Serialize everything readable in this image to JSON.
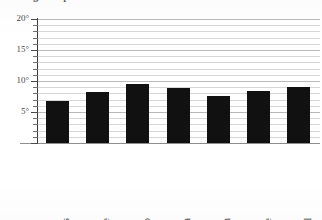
{
  "chart_data": {
    "type": "bar",
    "title": "Average temperature in Celsius",
    "xlabel": "",
    "ylabel": "",
    "categories": [
      "St Andrews",
      "Larne",
      "Sligo",
      "Swansea",
      "Harwich",
      "Eastbourne",
      "St Austell"
    ],
    "values": [
      6.8,
      8.2,
      9.5,
      8.8,
      7.6,
      8.4,
      9.0
    ],
    "ylim": [
      0,
      20
    ],
    "y_major_ticks": [
      "5",
      "10",
      "15",
      "20"
    ],
    "y_tick_labels": [
      "20°",
      "15°",
      "10°",
      "5°"
    ],
    "y_major_step": 5,
    "y_minor_step": 1,
    "grid": true,
    "legend": "none",
    "bar_color": "#111111",
    "gridline_color": "#d7d7d7",
    "axis_color": "#3a3a3a"
  }
}
